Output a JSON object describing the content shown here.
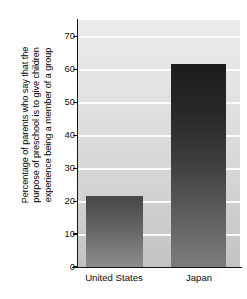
{
  "chart_data": {
    "type": "bar",
    "title": "",
    "subtitle": "",
    "xlabel": "",
    "ylabel": "Percentage of parents who say that the purpose of preschool is to give children experience being a member of a group",
    "ylabel_lines": [
      "Percentage of parents who say that the",
      "purpose of preschool is to give children",
      "experience being a member of a group"
    ],
    "categories": [
      "United States",
      "Japan"
    ],
    "values": [
      21.5,
      61.5
    ],
    "ylim": [
      0,
      75
    ],
    "yticks": [
      0,
      10,
      20,
      30,
      40,
      50,
      60,
      70
    ],
    "ytick_labels": [
      "0",
      "10",
      "20",
      "30",
      "40",
      "50",
      "60",
      "70"
    ],
    "grid": true,
    "grid_orientation": "horizontal",
    "grid_color": "#ffffff",
    "legend": false,
    "legend_position": "none",
    "plot_background_color": "#dcdcdc",
    "bar_colors": [
      "#6f6f6f",
      "#333333"
    ],
    "axis_color": "#151515"
  }
}
